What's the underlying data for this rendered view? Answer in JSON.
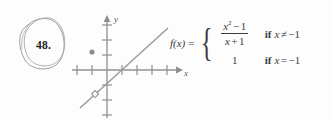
{
  "problem": {
    "number": "48.",
    "circle_color": "#8a8a8a"
  },
  "graph": {
    "axis_color": "#8f8f8f",
    "curve_color": "#9a9a9a",
    "x_axis_label": "x",
    "y_axis_label": "y",
    "x_axis": {
      "tick_count": 7,
      "tick_spacing": 15,
      "origin_x": 45,
      "axis_y": 64
    },
    "y_axis": {
      "tick_count": 7,
      "tick_spacing": 15
    },
    "chart_data": {
      "type": "line",
      "title": "",
      "xlabel": "x",
      "ylabel": "y",
      "grid": false,
      "legend": false,
      "xlim": [
        -3,
        5
      ],
      "ylim": [
        -4,
        4
      ],
      "series": [
        {
          "name": "f(x) = (x^2 - 1)/(x + 1)",
          "x": [
            -2.2,
            4.1
          ],
          "y": [
            -3.2,
            3.1
          ],
          "style": "solid-line"
        }
      ],
      "markers": [
        {
          "name": "removable-discontinuity",
          "x": -1,
          "y": -2,
          "style": "open"
        },
        {
          "name": "defined-value",
          "x": -1,
          "y": 1,
          "style": "filled"
        }
      ]
    }
  },
  "formula": {
    "function_name": "f(x)",
    "equals": "=",
    "cases": [
      {
        "value_type": "fraction",
        "numerator_base": "x",
        "numerator_exponent": "2",
        "numerator_operator": "−",
        "numerator_rest": "1",
        "denominator": "x + 1",
        "condition_if": "if",
        "condition": "x ≠ −1"
      },
      {
        "value_type": "scalar",
        "value": "1",
        "condition_if": "if",
        "condition": "x = −1"
      }
    ]
  }
}
